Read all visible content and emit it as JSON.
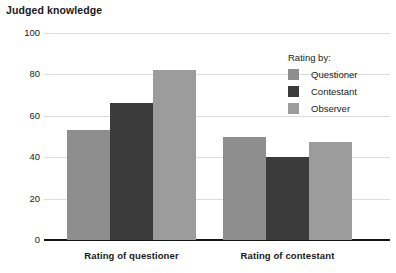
{
  "chart_data": {
    "type": "bar",
    "title": "Judged knowledge",
    "xlabel": "",
    "ylabel": "",
    "ylim": [
      0,
      100
    ],
    "yticks": [
      0,
      20,
      40,
      60,
      80,
      100
    ],
    "grid": true,
    "legend_position": "top-right",
    "legend_title": "Rating by:",
    "categories": [
      "Rating of questioner",
      "Rating of contestant"
    ],
    "series": [
      {
        "name": "Questioner",
        "color": "#8e8e8e",
        "values": [
          53,
          50
        ]
      },
      {
        "name": "Contestant",
        "color": "#3b3b3b",
        "values": [
          66,
          40
        ]
      },
      {
        "name": "Observer",
        "color": "#9c9c9c",
        "values": [
          82,
          47.5
        ]
      }
    ]
  },
  "axis": {
    "tick_labels": [
      "100",
      "80",
      "60",
      "40",
      "20",
      "0"
    ]
  },
  "legend": {
    "title": "Rating by:",
    "items": [
      {
        "label": "Questioner",
        "color": "#8e8e8e"
      },
      {
        "label": "Contestant",
        "color": "#3b3b3b"
      },
      {
        "label": "Observer",
        "color": "#9c9c9c"
      }
    ]
  }
}
